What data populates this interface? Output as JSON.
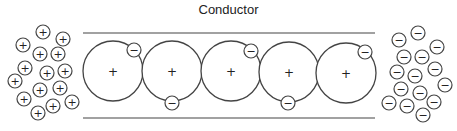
{
  "title": "Conductor",
  "conductor": {
    "boundary_top_y": 33,
    "boundary_bottom_y": 118,
    "x_start": 83,
    "x_end": 375,
    "atom_radius": 30,
    "atoms": [
      {
        "cx": 113,
        "cy": 71,
        "charge": "+"
      },
      {
        "cx": 172,
        "cy": 71,
        "charge": "+"
      },
      {
        "cx": 231,
        "cy": 71,
        "charge": "+"
      },
      {
        "cx": 289,
        "cy": 72,
        "charge": "+"
      },
      {
        "cx": 346,
        "cy": 73,
        "charge": "+"
      }
    ],
    "electrons": [
      {
        "cx": 134,
        "cy": 50,
        "charge": "−"
      },
      {
        "cx": 172,
        "cy": 103,
        "charge": "−"
      },
      {
        "cx": 251,
        "cy": 51,
        "charge": "−"
      },
      {
        "cx": 288,
        "cy": 103,
        "charge": "−"
      },
      {
        "cx": 365,
        "cy": 52,
        "charge": "−"
      }
    ]
  },
  "cations": {
    "charge": "+",
    "radius": 7,
    "positions": [
      [
        43,
        32
      ],
      [
        63,
        39
      ],
      [
        23,
        45
      ],
      [
        40,
        54
      ],
      [
        58,
        54
      ],
      [
        25,
        68
      ],
      [
        47,
        73
      ],
      [
        65,
        71
      ],
      [
        15,
        81
      ],
      [
        40,
        90
      ],
      [
        60,
        88
      ],
      [
        24,
        99
      ],
      [
        53,
        106
      ],
      [
        72,
        102
      ],
      [
        38,
        113
      ]
    ]
  },
  "anions": {
    "charge": "−",
    "radius": 7,
    "positions": [
      [
        418,
        33
      ],
      [
        399,
        40
      ],
      [
        437,
        47
      ],
      [
        404,
        57
      ],
      [
        422,
        57
      ],
      [
        435,
        69
      ],
      [
        397,
        72
      ],
      [
        415,
        76
      ],
      [
        445,
        85
      ],
      [
        401,
        89
      ],
      [
        420,
        93
      ],
      [
        434,
        102
      ],
      [
        389,
        103
      ],
      [
        407,
        106
      ],
      [
        423,
        115
      ]
    ]
  },
  "colors": {
    "stroke": "#444444",
    "background": "#ffffff"
  }
}
